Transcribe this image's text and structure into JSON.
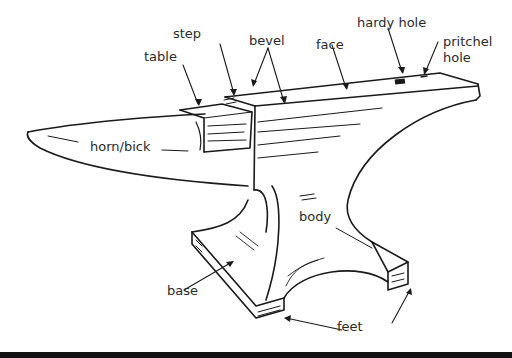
{
  "diagram": {
    "labels": {
      "step": "step",
      "table": "table",
      "bevel": "bevel",
      "face": "face",
      "hardy_hole": "hardy hole",
      "pritchel_hole_line1": "pritchel",
      "pritchel_hole_line2": "hole",
      "horn": "horn/bick",
      "body": "body",
      "base": "base",
      "feet": "feet"
    },
    "colors": {
      "line": "#1a1a1a",
      "background": "#ffffff",
      "bottom_bar": "#111111"
    }
  }
}
